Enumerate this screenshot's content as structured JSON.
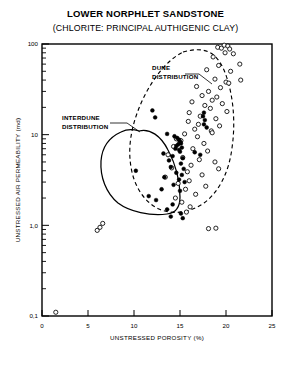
{
  "chart_data": {
    "type": "scatter",
    "title": "LOWER NORPHLET SANDSTONE",
    "subtitle": "(CHLORITE: PRINCIPAL AUTHIGENIC CLAY)",
    "xlabel": "UNSTRESSED POROSITY (%)",
    "ylabel": "UNSTRESSED AIR PERMEABILITY (md)",
    "xlim": [
      0,
      25
    ],
    "ylim": [
      0.1,
      100
    ],
    "yscale": "log",
    "xscale": "linear",
    "grid": false,
    "legend_position": "none",
    "xticks": [
      0,
      5,
      10,
      15,
      20,
      25
    ],
    "xtick_labels": [
      "0",
      "5",
      "10",
      "15",
      "20",
      "25"
    ],
    "yticks": [
      0.1,
      1.0,
      10,
      100
    ],
    "ytick_labels": [
      "0,1",
      "1,0",
      "10",
      "100"
    ],
    "annotations": [
      {
        "label_line1": "DUNE",
        "label_line2": "DISTRIBUTION",
        "name": "dune-distribution-label",
        "points_to": "dashed envelope"
      },
      {
        "label_line1": "INTERDUNE",
        "label_line2": "DISTRIBUTION",
        "name": "interdune-distribution-label",
        "points_to": "solid envelope"
      }
    ],
    "series": [
      {
        "name": "Dune distribution",
        "marker": "open-circle",
        "envelope": "dashed",
        "points": [
          [
            19.1,
            92.0
          ],
          [
            19.5,
            90.0
          ],
          [
            19.8,
            97.0
          ],
          [
            20.2,
            95.0
          ],
          [
            20.4,
            88.0
          ],
          [
            19.9,
            80.0
          ],
          [
            20.8,
            78.0
          ],
          [
            18.6,
            72.0
          ],
          [
            21.5,
            60.0
          ],
          [
            19.2,
            58.0
          ],
          [
            17.9,
            52.0
          ],
          [
            20.5,
            50.0
          ],
          [
            21.6,
            40.0
          ],
          [
            18.8,
            41.0
          ],
          [
            20.0,
            38.0
          ],
          [
            20.3,
            37.0
          ],
          [
            16.8,
            34.0
          ],
          [
            19.4,
            33.0
          ],
          [
            18.1,
            30.0
          ],
          [
            17.4,
            27.0
          ],
          [
            19.0,
            26.0
          ],
          [
            18.5,
            24.0
          ],
          [
            16.3,
            23.0
          ],
          [
            19.6,
            22.0
          ],
          [
            17.7,
            21.0
          ],
          [
            18.3,
            19.5
          ],
          [
            20.1,
            18.0
          ],
          [
            16.0,
            17.5
          ],
          [
            17.2,
            16.0
          ],
          [
            18.9,
            15.0
          ],
          [
            15.9,
            14.0
          ],
          [
            17.0,
            13.0
          ],
          [
            19.3,
            12.5
          ],
          [
            16.6,
            11.5
          ],
          [
            18.4,
            11.0
          ],
          [
            18.5,
            10.5
          ],
          [
            15.5,
            10.2
          ],
          [
            16.9,
            9.5
          ],
          [
            14.6,
            9.0
          ],
          [
            15.1,
            8.6
          ],
          [
            15.0,
            8.2
          ],
          [
            17.6,
            8.0
          ],
          [
            14.3,
            7.4
          ],
          [
            16.4,
            7.0
          ],
          [
            18.0,
            6.6
          ],
          [
            13.7,
            6.0
          ],
          [
            15.3,
            5.6
          ],
          [
            17.1,
            5.3
          ],
          [
            18.8,
            5.0
          ],
          [
            16.2,
            4.6
          ],
          [
            14.1,
            4.3
          ],
          [
            19.2,
            4.2
          ],
          [
            15.8,
            3.9
          ],
          [
            17.4,
            3.6
          ],
          [
            13.4,
            3.4
          ],
          [
            16.0,
            3.1
          ],
          [
            14.8,
            2.9
          ],
          [
            17.8,
            2.7
          ],
          [
            15.6,
            2.5
          ],
          [
            16.7,
            2.2
          ],
          [
            14.5,
            2.0
          ],
          [
            15.2,
            1.8
          ],
          [
            16.1,
            1.6
          ],
          [
            15.7,
            1.4
          ],
          [
            6.0,
            0.88
          ],
          [
            6.3,
            0.95
          ],
          [
            6.6,
            1.05
          ],
          [
            18.1,
            0.92
          ],
          [
            18.9,
            0.93
          ],
          [
            1.5,
            0.11
          ]
        ]
      },
      {
        "name": "Interdune distribution",
        "marker": "filled-circle",
        "envelope": "solid",
        "points": [
          [
            12.0,
            18.5
          ],
          [
            12.3,
            15.5
          ],
          [
            13.6,
            10.2
          ],
          [
            14.4,
            9.6
          ],
          [
            14.7,
            9.2
          ],
          [
            14.9,
            8.8
          ],
          [
            15.0,
            8.4
          ],
          [
            15.1,
            8.0
          ],
          [
            14.8,
            7.8
          ],
          [
            14.6,
            7.5
          ],
          [
            15.2,
            7.2
          ],
          [
            14.5,
            7.0
          ],
          [
            14.9,
            6.8
          ],
          [
            15.0,
            6.5
          ],
          [
            13.2,
            6.2
          ],
          [
            14.2,
            5.8
          ],
          [
            15.3,
            5.5
          ],
          [
            13.8,
            5.2
          ],
          [
            15.1,
            4.8
          ],
          [
            14.0,
            4.4
          ],
          [
            15.4,
            4.2
          ],
          [
            10.2,
            4.0
          ],
          [
            14.6,
            3.8
          ],
          [
            15.2,
            3.6
          ],
          [
            13.3,
            3.4
          ],
          [
            14.9,
            3.2
          ],
          [
            15.5,
            3.0
          ],
          [
            14.3,
            2.8
          ],
          [
            13.0,
            2.5
          ],
          [
            15.0,
            2.4
          ],
          [
            11.6,
            2.1
          ],
          [
            12.4,
            1.9
          ],
          [
            14.2,
            1.7
          ],
          [
            13.6,
            1.5
          ],
          [
            15.1,
            1.35
          ],
          [
            14.0,
            1.25
          ],
          [
            15.3,
            1.2
          ],
          [
            16.6,
            6.4
          ],
          [
            17.2,
            6.0
          ],
          [
            17.6,
            17.5
          ],
          [
            17.5,
            16.0
          ],
          [
            17.7,
            14.5
          ],
          [
            17.6,
            13.0
          ],
          [
            17.9,
            12.0
          ]
        ]
      }
    ]
  }
}
